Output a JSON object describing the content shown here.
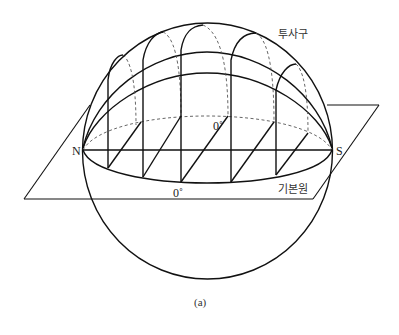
{
  "figure": {
    "caption": "(a)",
    "labels": {
      "north": "N",
      "south": "S",
      "projection_sphere": "투사구",
      "primitive_circle": "기본원",
      "zero_front": "0˚",
      "zero_back": "0˚"
    },
    "colors": {
      "line": "#111111",
      "dashed": "#555555",
      "background": "#ffffff"
    }
  }
}
